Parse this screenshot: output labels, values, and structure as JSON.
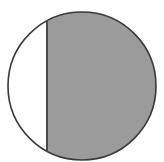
{
  "figure": {
    "name": "circle-with-vertical-chord",
    "type": "geometric-diagram",
    "canvas": {
      "width": 164,
      "height": 162,
      "background": "#ffffff"
    },
    "circle": {
      "center_x": 82,
      "center_y": 86,
      "radius": 74,
      "stroke_color": "#3a3a3a",
      "stroke_width": 1.6,
      "fill_color": "#ffffff"
    },
    "chord": {
      "orientation": "vertical",
      "x": 47,
      "y_top": 20,
      "y_bottom": 152,
      "stroke_color": "#4a4a4a",
      "stroke_width": 2
    },
    "segments": [
      {
        "name": "left-minor-segment",
        "side": "left",
        "fill_color": "#ffffff",
        "filled": false
      },
      {
        "name": "right-major-segment",
        "side": "right",
        "fill_color": "#9b9b9b",
        "filled": true
      }
    ]
  },
  "chart_data": {
    "type": "pie",
    "title": "",
    "subtitle": "",
    "xlabel": "",
    "ylabel": "",
    "grid": false,
    "legend_position": "none",
    "shape": "circle-divided-by-vertical-chord",
    "categories": [
      "unfilled-left-segment",
      "filled-right-segment"
    ],
    "values": [
      20,
      80
    ],
    "value_units": "percent-of-circle-area",
    "colors": [
      "#ffffff",
      "#9b9b9b"
    ],
    "annotations": [],
    "tick_labels": [],
    "notes": ""
  }
}
